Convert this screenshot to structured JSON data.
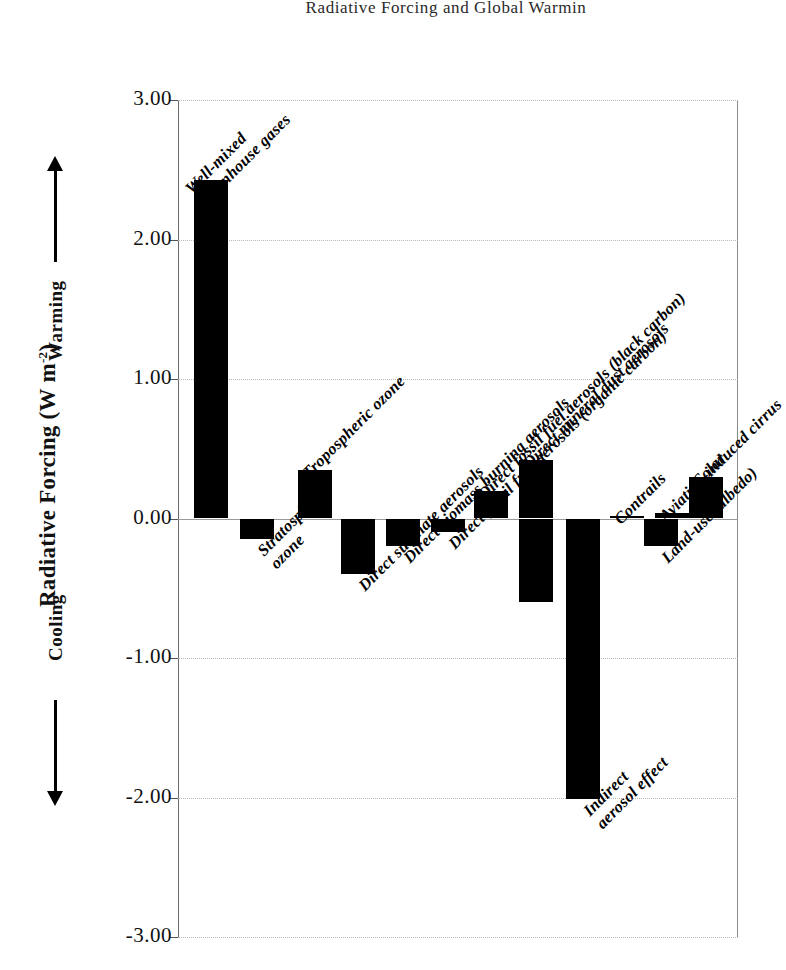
{
  "running_head": "Radiative Forcing and Global Warmin",
  "chart_data": {
    "type": "bar",
    "title": "",
    "xlabel": "",
    "ylabel": "Radiative Forcing (W m-2)",
    "ylabel_main": "Radiative Forcing (W m",
    "ylabel_exponent": "-2",
    "ylabel_close": ")",
    "ylim": [
      -3.0,
      3.0
    ],
    "grid": true,
    "legend": false,
    "yticks": [
      "3.00",
      "2.00",
      "1.00",
      "0.00",
      "-1.00",
      "-2.00",
      "-3.00"
    ],
    "ytick_values": [
      3.0,
      2.0,
      1.0,
      0.0,
      -1.0,
      -2.0,
      -3.0
    ],
    "direction_annotations": [
      {
        "label": "Warming",
        "icon": "up-arrow-icon"
      },
      {
        "label": "Cooling",
        "icon": "down-arrow-icon"
      }
    ],
    "categories": [
      "Well-mixed greenhouse gases",
      "Stratospheric ozone",
      "Tropospheric ozone",
      "Direct sulphate aerosols",
      "Direct biomass burning aerosols",
      "Direct fossil fuel aerosols (organic carbon)",
      "Direct fossil fuel aerosols (black carbon)",
      "Direct mineral dust aerosols",
      "Indirect aerosol effect",
      "Contrails",
      "Aviation-induced cirrus",
      "Land-use (albedo)",
      "Solar"
    ],
    "values": [
      2.43,
      -0.15,
      0.35,
      -0.4,
      -0.2,
      -0.1,
      0.2,
      0.42,
      -2.01,
      0.02,
      0.04,
      -0.2,
      0.3
    ],
    "extra_bars": [
      {
        "category": "Direct mineral dust aerosols",
        "value": -0.6,
        "note": "second dust bar (negative)"
      }
    ],
    "bars": [
      {
        "label": "Well-mixed greenhouse gases",
        "value": 2.43,
        "x": 16,
        "w": 34,
        "label_lines": [
          "Well-mixed",
          "greenhouse gases"
        ]
      },
      {
        "label": "Stratospheric ozone",
        "value": -0.15,
        "x": 62,
        "w": 34,
        "label_lines": [
          "Stratospheric",
          "ozone"
        ]
      },
      {
        "label": "Tropospheric ozone",
        "value": 0.35,
        "x": 120,
        "w": 34,
        "label_lines": [
          "Tropospheric ozone"
        ]
      },
      {
        "label": "Direct sulphate aerosols",
        "value": -0.4,
        "x": 163,
        "w": 34,
        "label_lines": [
          "Direct sulphate aerosols"
        ]
      },
      {
        "label": "Direct biomass burning aerosols",
        "value": -0.2,
        "x": 208,
        "w": 34,
        "label_lines": [
          "Direct biomass burning aerosols"
        ]
      },
      {
        "label": "Direct fossil fuel aerosols (organic carbon)",
        "value": -0.1,
        "x": 253,
        "w": 34,
        "label_lines": [
          "Direct fossil fuel aerosols (organic carbon)"
        ]
      },
      {
        "label": "Direct fossil fuel aerosols (black carbon)",
        "value": 0.2,
        "x": 296,
        "w": 34,
        "label_lines": [
          "Direct fossil fuel aerosols (black carbon)"
        ]
      },
      {
        "label": "Direct mineral dust aerosols",
        "value": 0.42,
        "x": 341,
        "w": 34,
        "label_lines": [
          "Direct mineral dust aerosols"
        ]
      },
      {
        "label": "Direct mineral dust aerosols (negative)",
        "value": -0.6,
        "x": 341,
        "w": 34,
        "label_lines": []
      },
      {
        "label": "Indirect aerosol effect",
        "value": -2.01,
        "x": 388,
        "w": 34,
        "label_lines": [
          "Indirect",
          "aerosol effect"
        ]
      },
      {
        "label": "Contrails",
        "value": 0.02,
        "x": 432,
        "w": 34,
        "label_lines": [
          "Contrails"
        ]
      },
      {
        "label": "Aviation-induced cirrus",
        "value": 0.04,
        "x": 477,
        "w": 34,
        "label_lines": [
          "Aviation-induced cirrus"
        ]
      },
      {
        "label": "Land-use (albedo)",
        "value": -0.2,
        "x": 466,
        "w": 34,
        "label_lines": [
          "Land-use (albedo)"
        ]
      },
      {
        "label": "Solar",
        "value": 0.3,
        "x": 511,
        "w": 34,
        "label_lines": [
          "Solar"
        ]
      }
    ]
  },
  "colors": {
    "bar": "#000000",
    "grid": "#b9b9b9",
    "axis": "#6a6a6a",
    "text": "#000000"
  }
}
